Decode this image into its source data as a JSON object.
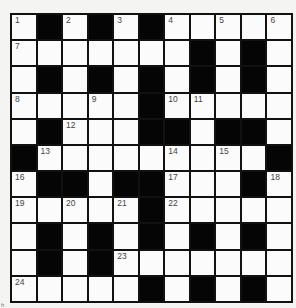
{
  "puzzle": {
    "rows": 11,
    "cols": 11,
    "layout": [
      "1#2#3#4.5.6",
      "7......#.#.",
      ".#.#.#.#.#.",
      "8..9.#AB...",
      ".#C..##.##.",
      "#D....E.F.#",
      "G##.##H..#I",
      "J.K.L#M....",
      ".#.#.#.#.#.",
      ".#.#N......",
      "O....#.#.#."
    ],
    "numbers": {
      "0,0": "1",
      "0,2": "2",
      "0,4": "3",
      "0,6": "4",
      "0,8": "5",
      "0,10": "6",
      "1,0": "7",
      "3,0": "8",
      "3,3": "9",
      "3,6": "10",
      "3,7": "11",
      "4,2": "12",
      "5,1": "13",
      "5,6": "14",
      "5,8": "15",
      "6,0": "16",
      "6,6": "17",
      "6,10": "18",
      "7,0": "19",
      "7,2": "20",
      "7,4": "21",
      "7,6": "22",
      "9,4": "23",
      "10,0": "24"
    },
    "colors": {
      "block": "#050505",
      "cell": "#fbfbfb",
      "number_text": "#444444"
    }
  },
  "footer_mark": "h"
}
